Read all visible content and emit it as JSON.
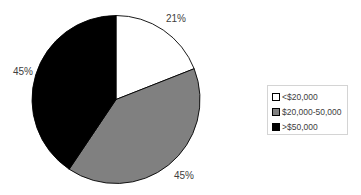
{
  "chart_data": {
    "type": "pie",
    "title": "",
    "categories": [
      "<$20,000",
      "$20,000-50,000",
      ">$50,000"
    ],
    "values": [
      21,
      45,
      45
    ],
    "value_labels": [
      "21%",
      "45%",
      "45%"
    ],
    "colors": [
      "#ffffff",
      "#808080",
      "#000000"
    ],
    "start_angle_deg": 0,
    "direction": "clockwise",
    "drawn_angles_deg": [
      68.5,
      145.4,
      146.1
    ],
    "legend_position": "right",
    "grid": false
  },
  "legend": {
    "items": [
      {
        "label": "<$20,000",
        "color": "#ffffff"
      },
      {
        "label": "$20,000-50,000",
        "color": "#808080"
      },
      {
        "label": ">$50,000",
        "color": "#000000"
      }
    ]
  },
  "labels": {
    "slice0": "21%",
    "slice1": "45%",
    "slice2": "45%"
  }
}
